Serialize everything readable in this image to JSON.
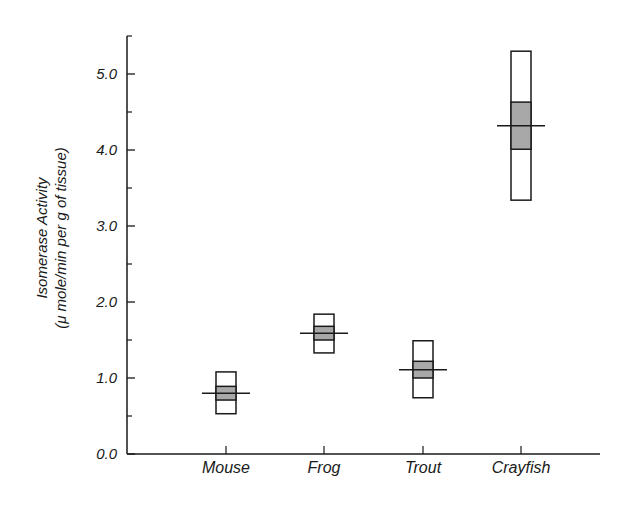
{
  "chart_data": {
    "type": "box",
    "title": "",
    "xlabel": "",
    "ylabel": "Isomerase Activity",
    "ylabel_units": "(μ mole/min per g of tissue)",
    "ylim": [
      0,
      5.5
    ],
    "yticks": [
      0,
      1,
      2,
      3,
      4,
      5
    ],
    "ytick_labels": [
      "0.0",
      "1.0",
      "2.0",
      "3.0",
      "4.0",
      "5.0"
    ],
    "yminor_ticks": [
      0.5,
      1.5,
      2.5,
      3.5,
      4.5,
      5.5
    ],
    "grid": false,
    "legend": null,
    "categories": [
      "Mouse",
      "Frog",
      "Trout",
      "Crayfish"
    ],
    "series": [
      {
        "name": "Mouse",
        "range_low": 0.53,
        "range_high": 1.08,
        "shaded_low": 0.71,
        "shaded_high": 0.89,
        "mean": 0.8
      },
      {
        "name": "Frog",
        "range_low": 1.33,
        "range_high": 1.84,
        "shaded_low": 1.5,
        "shaded_high": 1.68,
        "mean": 1.59
      },
      {
        "name": "Trout",
        "range_low": 0.74,
        "range_high": 1.49,
        "shaded_low": 1.0,
        "shaded_high": 1.22,
        "mean": 1.11
      },
      {
        "name": "Crayfish",
        "range_low": 3.34,
        "range_high": 5.3,
        "shaded_low": 4.01,
        "shaded_high": 4.63,
        "mean": 4.32
      }
    ],
    "colors": {
      "box_fill": "#ffffff",
      "shaded_fill": "#a8a8a8",
      "stroke": "#1a1a1a"
    }
  }
}
